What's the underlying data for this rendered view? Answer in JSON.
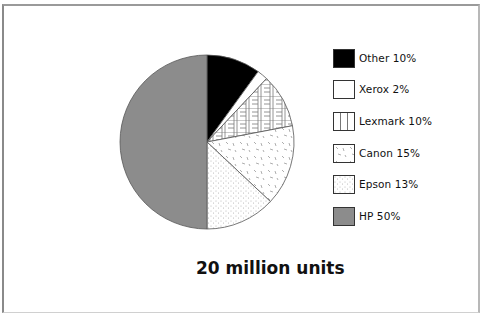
{
  "chart_data": {
    "type": "pie",
    "title": "20 million units",
    "categories": [
      "Other",
      "Xerox",
      "Lexmark",
      "Canon",
      "Epson",
      "HP"
    ],
    "values": [
      10,
      2,
      10,
      15,
      13,
      50
    ],
    "unit": "%",
    "legend_position": "right",
    "legend_entries": [
      "Other 10%",
      "Xerox 2%",
      "Lexmark 10%",
      "Canon 15%",
      "Epson 13%",
      "HP 50%"
    ],
    "fills": [
      "solid-black",
      "white",
      "grid-hatch",
      "dash-speckle",
      "dot-stipple",
      "solid-gray"
    ]
  },
  "colors": {
    "other": "#000000",
    "xerox": "#ffffff",
    "lexmark": "#ffffff",
    "canon": "#ffffff",
    "epson": "#ffffff",
    "hp": "#8c8c8c",
    "outline": "#555555"
  },
  "legend": {
    "items": [
      {
        "label": "Other  10%"
      },
      {
        "label": "Xerox  2%"
      },
      {
        "label": "Lexmark  10%"
      },
      {
        "label": "Canon  15%"
      },
      {
        "label": "Epson  13%"
      },
      {
        "label": "HP  50%"
      }
    ]
  },
  "title": "20 million units"
}
